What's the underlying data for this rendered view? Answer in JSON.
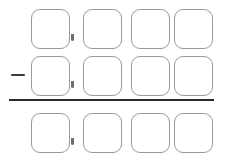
{
  "worksheet": {
    "title": "Column Subtraction Problem",
    "operator": {
      "name": "subtraction-operator",
      "symbol": "−",
      "glyph_name": "minus-sign"
    },
    "rule": {
      "name": "answer-rule",
      "label": "answer line"
    },
    "separator": {
      "name": "place-value-tick",
      "symbol": ","
    },
    "columns": [
      "thousands",
      "hundreds",
      "tens",
      "ones"
    ],
    "rows": [
      {
        "id": "minuend",
        "role": "minuend",
        "operator": "",
        "has_separator": true,
        "cells": [
          {
            "name": "minuend-thousands",
            "value": ""
          },
          {
            "name": "minuend-hundreds",
            "value": ""
          },
          {
            "name": "minuend-tens",
            "value": ""
          },
          {
            "name": "minuend-ones",
            "value": ""
          }
        ]
      },
      {
        "id": "subtrahend",
        "role": "subtrahend",
        "operator": "−",
        "has_separator": true,
        "cells": [
          {
            "name": "subtrahend-thousands",
            "value": ""
          },
          {
            "name": "subtrahend-hundreds",
            "value": ""
          },
          {
            "name": "subtrahend-tens",
            "value": ""
          },
          {
            "name": "subtrahend-ones",
            "value": ""
          }
        ]
      },
      {
        "id": "answer",
        "role": "difference",
        "operator": "",
        "has_separator": true,
        "cells": [
          {
            "name": "answer-thousands",
            "value": ""
          },
          {
            "name": "answer-hundreds",
            "value": ""
          },
          {
            "name": "answer-tens",
            "value": ""
          },
          {
            "name": "answer-ones",
            "value": ""
          }
        ]
      }
    ],
    "colors": {
      "box_border": "#9a9a9a",
      "rule": "#2a2a2a",
      "operator": "#3a3a3a",
      "tick": "#6f6f6f",
      "background": "#ffffff"
    }
  }
}
